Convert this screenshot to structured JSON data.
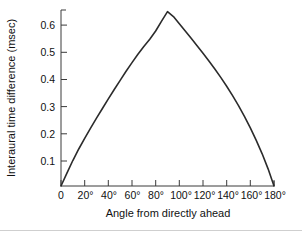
{
  "figure": {
    "background": "#ffffff",
    "curve_color": "#2b2b2b",
    "axis_color": "#3a3a3a",
    "text_color": "#111111"
  },
  "chart_data": {
    "type": "line",
    "title": "",
    "subtitle": "",
    "xlabel": "Angle from directly ahead",
    "ylabel": "Interaural time difference (msec)",
    "xlim": [
      0,
      180
    ],
    "ylim": [
      0,
      0.69
    ],
    "grid": false,
    "legend": null,
    "xticks": [
      0,
      20,
      40,
      60,
      80,
      100,
      120,
      140,
      160,
      180
    ],
    "xticklabels": [
      "0",
      "20°",
      "40°",
      "60°",
      "80°",
      "100°",
      "120°",
      "140°",
      "160°",
      "180°"
    ],
    "yticks": [
      0.1,
      0.2,
      0.3,
      0.4,
      0.5,
      0.6
    ],
    "yticklabels": [
      "0.1",
      "0.2",
      "0.3",
      "0.4",
      "0.5",
      "0.6"
    ],
    "series": [
      {
        "name": "Interaural time difference",
        "x": [
          0,
          5,
          10,
          15,
          20,
          25,
          30,
          35,
          40,
          45,
          50,
          55,
          60,
          65,
          70,
          75,
          80,
          85,
          90,
          95,
          100,
          105,
          110,
          115,
          120,
          125,
          130,
          135,
          140,
          145,
          150,
          155,
          160,
          165,
          170,
          175,
          180
        ],
        "y": [
          0.0,
          0.048,
          0.095,
          0.138,
          0.178,
          0.216,
          0.253,
          0.289,
          0.325,
          0.36,
          0.394,
          0.428,
          0.46,
          0.491,
          0.52,
          0.547,
          0.578,
          0.615,
          0.65,
          0.632,
          0.605,
          0.578,
          0.551,
          0.523,
          0.495,
          0.466,
          0.436,
          0.405,
          0.372,
          0.337,
          0.3,
          0.26,
          0.217,
          0.17,
          0.12,
          0.064,
          0.0
        ]
      }
    ],
    "annotations": {
      "peak_value": 0.65,
      "peak_angle": 90
    }
  },
  "axis_labels": {
    "x_title": "Angle from directly ahead",
    "y_title": "Interaural time difference (msec)"
  }
}
